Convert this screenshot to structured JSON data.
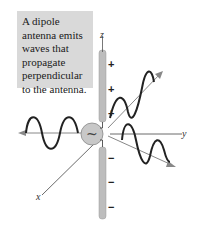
{
  "caption": "A dipole antenna emits waves that propagate perpendicular to the antenna.",
  "axes": {
    "x": "x",
    "y": "y",
    "z": "z"
  },
  "charges": {
    "upper": [
      "+",
      "+",
      "+"
    ],
    "lower": [
      "−",
      "−",
      "−"
    ]
  },
  "source_symbol": "~",
  "colors": {
    "caption_bg": "#d9d9d9",
    "antenna": "#bdbdbd",
    "source": "#c8c8c8",
    "wave": "#222222",
    "axis": "#555555"
  }
}
